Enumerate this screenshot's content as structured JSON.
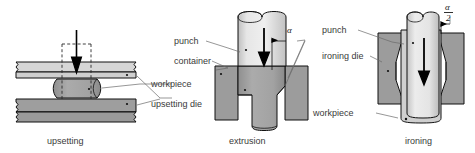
{
  "figure": {
    "background_color": "#ffffff",
    "colors": {
      "light_gray": "#d9d9d9",
      "mid_gray": "#a8a8a8",
      "dark_gray": "#8a8a8a",
      "outline": "#111111",
      "text": "#3a3a3a",
      "leader": "#6a6a6a",
      "arrow": "#000000"
    }
  },
  "panels": [
    {
      "id": "upsetting",
      "caption": "upsetting",
      "labels": [
        {
          "key": "workpiece",
          "text": "workpiece"
        },
        {
          "key": "upsetting_die",
          "text": "upsetting die"
        }
      ],
      "annotations": []
    },
    {
      "id": "extrusion",
      "caption": "extrusion",
      "labels": [
        {
          "key": "punch",
          "text": "punch"
        },
        {
          "key": "container",
          "text": "container"
        }
      ],
      "annotations": [
        {
          "key": "angle_alpha",
          "text": "α"
        }
      ]
    },
    {
      "id": "ironing",
      "caption": "ironing",
      "labels": [
        {
          "key": "punch",
          "text": "punch"
        },
        {
          "key": "ironing_die",
          "text": "ironing die"
        },
        {
          "key": "workpiece",
          "text": "workpiece"
        }
      ],
      "annotations": [
        {
          "key": "angle_alpha_half_numerator",
          "text": "α"
        },
        {
          "key": "angle_alpha_half_denominator",
          "text": "2"
        }
      ]
    }
  ]
}
